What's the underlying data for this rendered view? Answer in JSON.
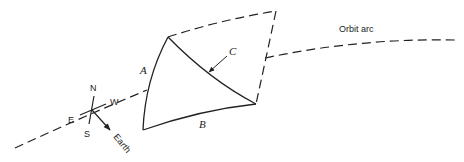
{
  "diagram": {
    "type": "orbit-window-geometry",
    "labels": {
      "orbit": "Orbit arc",
      "edge_a": "A",
      "edge_b": "B",
      "diagonal_c": "C",
      "north": "N",
      "south": "S",
      "east": "E",
      "west": "W",
      "earth": "Earth"
    },
    "colors": {
      "stroke": "#222222",
      "background": "#ffffff"
    }
  }
}
